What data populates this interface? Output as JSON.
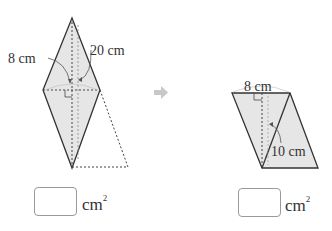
{
  "figure_left": {
    "label_diagonal_short": "8 cm",
    "label_diagonal_long": "20 cm"
  },
  "figure_right": {
    "label_base": "8 cm",
    "label_height": "10 cm"
  },
  "arrow": {
    "icon": "right-arrow-icon",
    "color": "#c8c8c8"
  },
  "answers": {
    "left_unit": "cm",
    "left_unit_exp": "2",
    "right_unit": "cm",
    "right_unit_exp": "2"
  },
  "colors": {
    "fill": "#e6e6e6",
    "stroke": "#333333",
    "dotted": "#444444",
    "arrow": "#c8c8c8"
  }
}
